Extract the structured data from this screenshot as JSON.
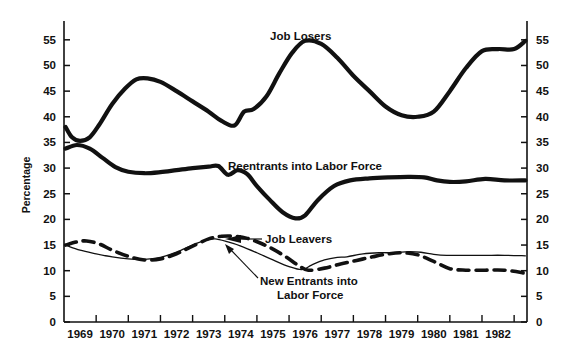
{
  "chart_data": {
    "type": "line",
    "title": "",
    "xlabel": "",
    "ylabel": "Percentage",
    "ylim": [
      0,
      57.5
    ],
    "yticks": [
      0,
      5,
      10,
      15,
      20,
      25,
      30,
      35,
      40,
      45,
      50,
      55
    ],
    "grid": false,
    "legend_position": "inline-annotations",
    "categories": [
      "1969",
      "1970",
      "1971",
      "1972",
      "1973",
      "1974",
      "1975",
      "1976",
      "1977",
      "1978",
      "1979",
      "1980",
      "1981",
      "1982"
    ],
    "xlim": [
      1968.5,
      1982.9
    ],
    "series": [
      {
        "name": "Job Losers",
        "style": "thick-solid",
        "color": "#111111",
        "x": [
          1968.55,
          1968.75,
          1969.0,
          1969.3,
          1969.6,
          1970.0,
          1970.4,
          1970.75,
          1971.1,
          1971.5,
          1972.0,
          1972.5,
          1973.0,
          1973.4,
          1973.8,
          1974.1,
          1974.4,
          1974.8,
          1975.2,
          1975.6,
          1976.0,
          1976.5,
          1977.0,
          1977.5,
          1978.0,
          1978.5,
          1979.0,
          1979.5,
          1980.0,
          1980.5,
          1981.0,
          1981.5,
          1982.0,
          1982.5,
          1982.85
        ],
        "values": [
          38.0,
          36.0,
          35.3,
          36.0,
          38.5,
          42.5,
          45.5,
          47.3,
          47.5,
          46.8,
          45.0,
          43.0,
          41.0,
          39.2,
          38.3,
          41.0,
          41.5,
          44.0,
          48.5,
          52.5,
          54.8,
          54.2,
          51.5,
          48.0,
          45.0,
          42.0,
          40.3,
          40.0,
          41.0,
          45.0,
          49.5,
          52.8,
          53.2,
          53.2,
          54.8
        ]
      },
      {
        "name": "Reentrants into Labor Force",
        "style": "thick-solid",
        "color": "#111111",
        "x": [
          1968.55,
          1968.9,
          1969.3,
          1969.7,
          1970.1,
          1970.5,
          1971.0,
          1971.5,
          1972.0,
          1972.5,
          1973.0,
          1973.3,
          1973.6,
          1973.9,
          1974.2,
          1974.5,
          1974.9,
          1975.3,
          1975.7,
          1976.0,
          1976.4,
          1976.9,
          1977.4,
          1978.0,
          1978.6,
          1979.2,
          1979.7,
          1980.1,
          1980.5,
          1981.0,
          1981.6,
          1982.2,
          1982.85
        ],
        "values": [
          33.8,
          34.5,
          33.8,
          32.0,
          30.2,
          29.3,
          29.0,
          29.2,
          29.6,
          30.0,
          30.3,
          30.4,
          28.7,
          29.6,
          28.8,
          26.5,
          23.8,
          21.4,
          20.2,
          20.8,
          23.8,
          26.5,
          27.6,
          28.0,
          28.2,
          28.3,
          28.2,
          27.6,
          27.3,
          27.4,
          27.9,
          27.6,
          27.6
        ]
      },
      {
        "name": "Job Leavers",
        "style": "thick-dashed",
        "color": "#111111",
        "x": [
          1968.55,
          1968.9,
          1969.2,
          1969.6,
          1970.0,
          1970.5,
          1971.0,
          1971.5,
          1972.0,
          1972.5,
          1973.0,
          1973.4,
          1973.8,
          1974.2,
          1974.6,
          1975.0,
          1975.4,
          1975.8,
          1976.1,
          1976.6,
          1977.1,
          1977.6,
          1978.1,
          1978.6,
          1979.0,
          1979.5,
          1980.0,
          1980.5,
          1981.0,
          1981.6,
          1982.2,
          1982.85
        ],
        "values": [
          15.0,
          15.6,
          15.8,
          15.2,
          14.0,
          12.8,
          12.1,
          12.3,
          13.3,
          14.8,
          16.2,
          16.7,
          16.7,
          16.3,
          15.4,
          14.2,
          12.7,
          11.0,
          10.1,
          10.5,
          11.3,
          12.0,
          12.7,
          13.3,
          13.5,
          13.1,
          11.8,
          10.4,
          10.1,
          10.1,
          10.1,
          9.5
        ]
      },
      {
        "name": "New Entrants into Labor Force",
        "style": "thin-solid",
        "color": "#111111",
        "x": [
          1968.55,
          1969.0,
          1969.5,
          1970.0,
          1970.5,
          1971.0,
          1971.5,
          1972.0,
          1972.5,
          1972.9,
          1973.2,
          1973.6,
          1974.0,
          1974.5,
          1975.0,
          1975.5,
          1975.9,
          1976.2,
          1976.6,
          1977.0,
          1977.3,
          1977.8,
          1978.3,
          1978.8,
          1979.2,
          1979.6,
          1980.0,
          1980.4,
          1981.0,
          1981.6,
          1982.2,
          1982.85
        ],
        "values": [
          15.0,
          14.0,
          13.3,
          12.7,
          12.3,
          12.2,
          12.6,
          13.6,
          15.0,
          15.9,
          16.2,
          15.6,
          14.8,
          13.5,
          12.1,
          10.8,
          10.2,
          11.1,
          12.1,
          12.6,
          12.7,
          13.3,
          13.5,
          13.5,
          13.7,
          13.6,
          13.2,
          13.0,
          13.0,
          13.0,
          13.0,
          12.9
        ]
      }
    ],
    "annotations": [
      {
        "name": "job-losers",
        "text": "Job Losers",
        "x": 270,
        "y": 40
      },
      {
        "name": "reentrants",
        "text": "Reentrants into Labor Force",
        "x": 228,
        "y": 170
      },
      {
        "name": "job-leavers",
        "text": "Job Leavers",
        "x": 265,
        "y": 243
      },
      {
        "name": "new-entrants-line1",
        "text": "New Entrants into",
        "x": 260,
        "y": 285
      },
      {
        "name": "new-entrants-line2",
        "text": "Labor Force",
        "x": 277,
        "y": 299
      }
    ]
  },
  "axis": {
    "y_title": "Percentage",
    "y_ticks_left": [
      "55",
      "50",
      "45",
      "40",
      "35",
      "30",
      "25",
      "20",
      "15",
      "10",
      "5",
      "0"
    ],
    "y_ticks_right": [
      "55",
      "50",
      "45",
      "40",
      "35",
      "30",
      "25",
      "20",
      "15",
      "10",
      "5",
      "0"
    ],
    "x_ticks": [
      "1969",
      "1970",
      "1971",
      "1972",
      "1973",
      "1974",
      "1975",
      "1976",
      "1977",
      "1978",
      "1979",
      "1980",
      "1981",
      "1982"
    ]
  },
  "colors": {
    "ink": "#111111",
    "background": "#ffffff"
  }
}
